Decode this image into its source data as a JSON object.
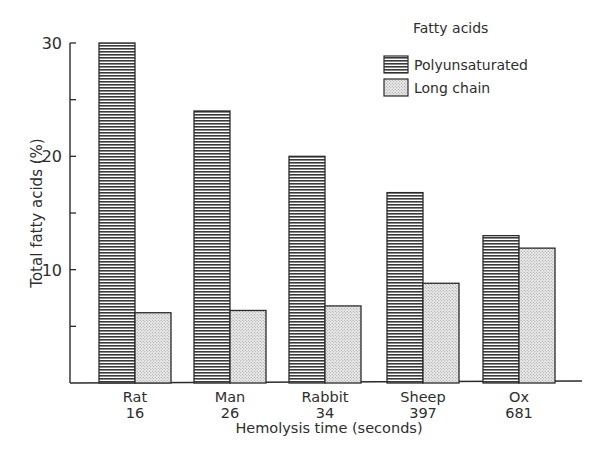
{
  "chart_data": {
    "type": "bar",
    "title": "",
    "xlabel": "Hemolysis time (seconds)",
    "ylabel": "Total fatty acids (%)",
    "ylim": [
      0,
      30
    ],
    "yticks": [
      0,
      5,
      10,
      15,
      20,
      25,
      30
    ],
    "ytick_labels": [
      "",
      "",
      "10",
      "",
      "20",
      "",
      "30"
    ],
    "grid": false,
    "legend_position": "upper right",
    "legend_title": "Fatty acids",
    "categories": [
      "Rat",
      "Man",
      "Rabbit",
      "Sheep",
      "Ox"
    ],
    "category_sublabels": [
      "16",
      "26",
      "34",
      "397",
      "681"
    ],
    "series": [
      {
        "name": "Polyunsaturated",
        "pattern": "horizontal-lines",
        "values": [
          30,
          24,
          20,
          16.8,
          13
        ]
      },
      {
        "name": "Long chain",
        "pattern": "stipple",
        "values": [
          6.2,
          6.4,
          6.8,
          8.8,
          11.9
        ]
      }
    ]
  },
  "colors": {
    "ink": "#2a2a2a",
    "background": "#ffffff",
    "stipple_fill": "#e2e2e2"
  }
}
